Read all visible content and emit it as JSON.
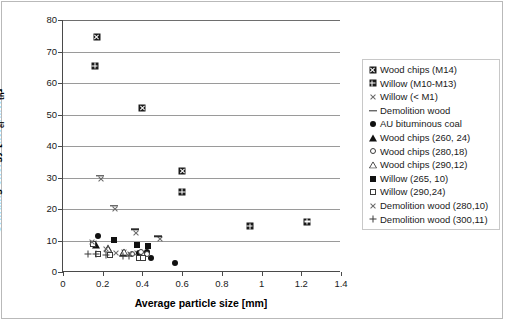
{
  "chart_data": {
    "type": "scatter",
    "title": "",
    "xlabel": "Average particle size [mm]",
    "ylabel": "Grinding energy [kWel/MWth]",
    "ylabel_parts": {
      "main": "Grinding energy [kW",
      "sub1": "el",
      "mid": "/MW",
      "sub2": "th",
      "end": "]"
    },
    "xlim": [
      0,
      1.4
    ],
    "ylim": [
      0,
      80
    ],
    "xticks": [
      "0",
      "0.2",
      "0.4",
      "0.6",
      "0.8",
      "1",
      "1.2",
      "1.4"
    ],
    "xtick_values": [
      0,
      0.2,
      0.4,
      0.6,
      0.8,
      1,
      1.2,
      1.4
    ],
    "yticks": [
      "0",
      "10",
      "20",
      "30",
      "40",
      "50",
      "60",
      "70",
      "80"
    ],
    "ytick_values": [
      0,
      10,
      20,
      30,
      40,
      50,
      60,
      70,
      80
    ],
    "grid": "horizontal",
    "legend_position": "right",
    "series": [
      {
        "name": "Wood chips (M14)",
        "marker": "boxx",
        "points": [
          [
            0.17,
            74.5
          ],
          [
            0.4,
            52.0
          ],
          [
            0.6,
            32.0
          ]
        ]
      },
      {
        "name": "Willow (M10-M13)",
        "marker": "boxplus",
        "points": [
          [
            0.16,
            65.5
          ],
          [
            0.6,
            25.5
          ],
          [
            0.94,
            14.5
          ],
          [
            1.23,
            16.0
          ]
        ]
      },
      {
        "name": "Willow (< M1)",
        "marker": "x",
        "points": [
          [
            0.19,
            29.5
          ],
          [
            0.26,
            20.0
          ],
          [
            0.37,
            12.5
          ],
          [
            0.49,
            10.5
          ],
          [
            0.155,
            9.3
          ],
          [
            0.305,
            6.2
          ],
          [
            0.375,
            6.0
          ]
        ]
      },
      {
        "name": "Demolition wood",
        "marker": "dash",
        "points": [
          [
            0.185,
            30.5
          ],
          [
            0.255,
            21.0
          ],
          [
            0.365,
            13.5
          ],
          [
            0.48,
            11.3
          ]
        ]
      },
      {
        "name": "AU bituminous coal",
        "marker": "circle",
        "points": [
          [
            0.175,
            11.5
          ],
          [
            0.385,
            6.0
          ],
          [
            0.425,
            6.3
          ],
          [
            0.445,
            4.3
          ],
          [
            0.565,
            3.0
          ]
        ]
      },
      {
        "name": "Wood chips (260, 24)",
        "marker": "triangle",
        "points": [
          [
            0.165,
            8.6
          ],
          [
            0.225,
            7.6
          ],
          [
            0.3,
            6.1
          ]
        ]
      },
      {
        "name": "Wood chips (280,18)",
        "marker": "open-circle",
        "points": [
          [
            0.345,
            5.6
          ],
          [
            0.395,
            6.2
          ],
          [
            0.425,
            5.8
          ]
        ]
      },
      {
        "name": "Wood chips (290,12)",
        "marker": "open-triangle",
        "points": [
          [
            0.225,
            7.3
          ],
          [
            0.305,
            6.4
          ]
        ]
      },
      {
        "name": "Willow (265, 10)",
        "marker": "square",
        "points": [
          [
            0.255,
            10.2
          ],
          [
            0.375,
            8.6
          ],
          [
            0.43,
            8.3
          ]
        ]
      },
      {
        "name": "Willow (290,24)",
        "marker": "open-square",
        "points": [
          [
            0.15,
            8.8
          ],
          [
            0.175,
            5.7
          ],
          [
            0.235,
            5.5
          ],
          [
            0.385,
            4.6
          ],
          [
            0.405,
            4.5
          ]
        ]
      },
      {
        "name": "Demolition wood (280,10)",
        "marker": "x",
        "points": [
          [
            0.145,
            9.5
          ],
          [
            0.215,
            7.3
          ],
          [
            0.265,
            5.9
          ],
          [
            0.335,
            5.6
          ]
        ]
      },
      {
        "name": "Demolition wood (300,11)",
        "marker": "plus",
        "points": [
          [
            0.125,
            5.8
          ],
          [
            0.165,
            5.6
          ],
          [
            0.215,
            5.4
          ],
          [
            0.3,
            5.2
          ],
          [
            0.33,
            5.0
          ]
        ]
      }
    ]
  }
}
